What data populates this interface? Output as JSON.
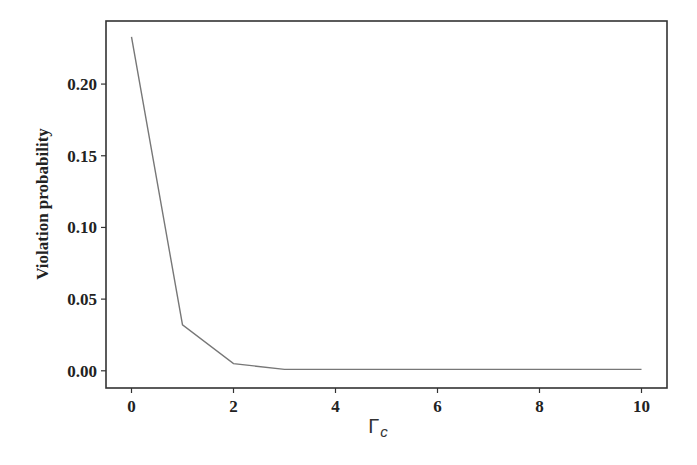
{
  "chart_data": {
    "type": "line",
    "title": "",
    "xlabel": "Γ",
    "xlabel_subscript": "c",
    "ylabel": "Violation probability",
    "x": [
      0,
      1,
      2,
      3,
      4,
      5,
      6,
      7,
      8,
      9,
      10
    ],
    "series": [
      {
        "name": "Violation probability",
        "color": "#777777",
        "values": [
          0.233,
          0.032,
          0.005,
          0.001,
          0.001,
          0.001,
          0.001,
          0.001,
          0.001,
          0.001,
          0.001
        ]
      }
    ],
    "xlim": [
      -0.5,
      10.5
    ],
    "ylim": [
      -0.012,
      0.244
    ],
    "xticks": [
      0,
      2,
      4,
      6,
      8,
      10
    ],
    "xtick_labels": [
      "0",
      "2",
      "4",
      "6",
      "8",
      "10"
    ],
    "yticks": [
      0.0,
      0.05,
      0.1,
      0.15,
      0.2
    ],
    "ytick_labels": [
      "0.00",
      "0.05",
      "0.10",
      "0.15",
      "0.20"
    ],
    "grid": false,
    "legend": null
  }
}
